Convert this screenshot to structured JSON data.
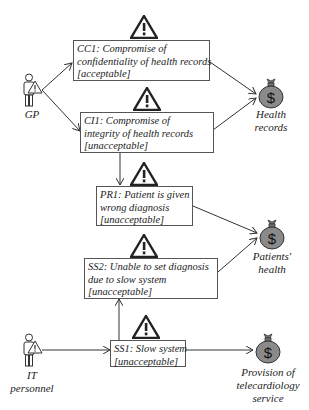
{
  "actors": [
    {
      "id": "gp",
      "label": "GP",
      "icon": "person-with-warning-icon"
    },
    {
      "id": "it",
      "label": "IT\npersonnel",
      "icon": "person-with-warning-icon"
    }
  ],
  "incidents": [
    {
      "id": "CC1",
      "line1": "CC1: Compromise of",
      "line2": "confidentiality of health records",
      "line3": "[acceptable]",
      "risk": "acceptable"
    },
    {
      "id": "CI1",
      "line1": "CI1: Compromise of",
      "line2": "integrity of health records",
      "line3": "[unacceptable]",
      "risk": "unacceptable"
    },
    {
      "id": "PR1",
      "line1": "PR1: Patient is given",
      "line2": "wrong diagnosis",
      "line3": "[unacceptable]",
      "risk": "unacceptable"
    },
    {
      "id": "SS2",
      "line1": "SS2: Unable to set diagnosis",
      "line2": "due to slow system",
      "line3": "[unacceptable]",
      "risk": "unacceptable"
    },
    {
      "id": "SS1",
      "line1": "SS1: Slow system",
      "line2": "[unacceptable]",
      "risk": "unacceptable"
    }
  ],
  "assets": [
    {
      "id": "hr",
      "label1": "Health",
      "label2": "records",
      "icon": "money-bag-icon"
    },
    {
      "id": "ph",
      "label1": "Patients'",
      "label2": "health",
      "icon": "money-bag-icon"
    },
    {
      "id": "pt",
      "label1": "Provision of",
      "label2": "telecardiology",
      "label3": "service",
      "icon": "money-bag-icon"
    }
  ],
  "colors": {
    "asset_fill": "#8a8a8a",
    "border": "#555555",
    "line": "#333333"
  }
}
